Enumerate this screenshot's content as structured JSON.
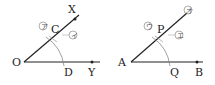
{
  "figures": [
    {
      "name": "original-angle",
      "vertex": "O",
      "ray_points": [
        "X",
        "Y"
      ],
      "arc_points": [
        "C",
        "D"
      ],
      "circled_marks": [
        "ア",
        "イ"
      ]
    },
    {
      "name": "copied-angle",
      "vertex": "A",
      "ray_points": [
        "B"
      ],
      "arc_points": [
        "P",
        "Q"
      ],
      "circled_marks": [
        "ウ",
        "エ",
        "オ"
      ]
    }
  ],
  "labels": {
    "O": "O",
    "X": "X",
    "Y": "Y",
    "C": "C",
    "D": "D",
    "A": "A",
    "B": "B",
    "P": "P",
    "Q": "Q",
    "m1": "ア",
    "m2": "イ",
    "m3": "ウ",
    "m4": "エ",
    "m5": "オ"
  },
  "colors": {
    "line": "#222222",
    "arc": "#888888",
    "mark": "#666666"
  }
}
